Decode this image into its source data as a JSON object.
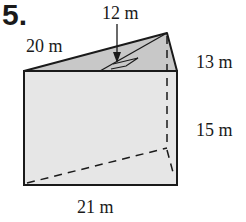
{
  "problem": {
    "number": "5.",
    "description": "Triangular prism with labeled dimensions"
  },
  "labels": {
    "slant_top": "20 m",
    "triangle_height": "12 m",
    "side_edge": "13 m",
    "prism_height": "15 m",
    "base_length": "21 m"
  },
  "colors": {
    "stroke": "#1a1a1a",
    "face_fill": "#e6e6e6",
    "top_fill": "#c8c8c8",
    "background": "#ffffff"
  }
}
